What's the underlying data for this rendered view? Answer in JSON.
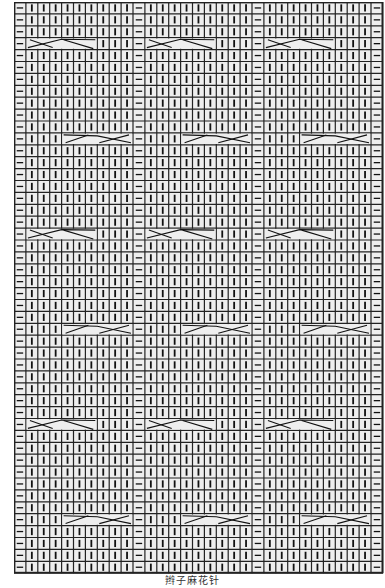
{
  "diagram": {
    "type": "knitting-chart",
    "caption": "辫子麻花针",
    "columns": 31,
    "rows": 48,
    "cell_size_px": 11.9,
    "colors": {
      "background": "#ffffff",
      "cell_fill": "#eeeeee",
      "grid_line": "#222222",
      "symbol": "#111111"
    },
    "symbols": {
      "knit": "|",
      "purl": "—",
      "cable": "crossed-lines"
    },
    "column_pattern": {
      "description": "purl, 9 knit, repeated 3 times, then final purl",
      "repeat": [
        "purl",
        "knit",
        "knit",
        "knit",
        "knit",
        "knit",
        "knit",
        "knit",
        "knit",
        "knit"
      ],
      "repeat_count": 3,
      "final": "purl"
    },
    "group_start_columns": [
      0,
      10,
      20
    ],
    "cables": [
      {
        "row": 3,
        "type": "left-cable",
        "offset_start": 1,
        "width": 6
      },
      {
        "row": 11,
        "type": "right-cable",
        "offset_start": 4,
        "width": 6
      },
      {
        "row": 19,
        "type": "left-cable",
        "offset_start": 1,
        "width": 6
      },
      {
        "row": 27,
        "type": "right-cable",
        "offset_start": 4,
        "width": 6
      },
      {
        "row": 35,
        "type": "left-cable",
        "offset_start": 1,
        "width": 6
      },
      {
        "row": 43,
        "type": "right-cable",
        "offset_start": 4,
        "width": 6
      }
    ]
  }
}
